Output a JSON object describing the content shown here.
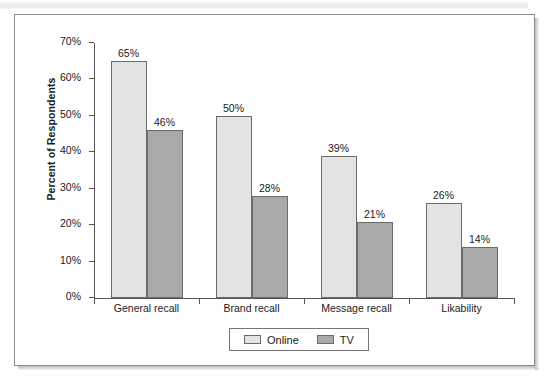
{
  "chart_data": {
    "type": "bar",
    "title": "",
    "xlabel": "",
    "ylabel": "Percent of Respondents",
    "ylim": [
      0,
      70
    ],
    "ytick_labels": [
      "0%",
      "10%",
      "20%",
      "30%",
      "40%",
      "50%",
      "60%",
      "70%"
    ],
    "ytick_values": [
      0,
      10,
      20,
      30,
      40,
      50,
      60,
      70
    ],
    "grid": false,
    "legend_position": "bottom-center",
    "categories": [
      "General recall",
      "Brand recall",
      "Message recall",
      "Likability"
    ],
    "series": [
      {
        "name": "Online",
        "color": "#e3e3e3",
        "values": [
          65,
          50,
          39,
          26
        ],
        "value_labels": [
          "65%",
          "50%",
          "39%",
          "26%"
        ]
      },
      {
        "name": "TV",
        "color": "#a9a9a9",
        "values": [
          46,
          28,
          21,
          14
        ],
        "value_labels": [
          "46%",
          "28%",
          "21%",
          "14%"
        ]
      }
    ]
  },
  "legend": {
    "items": [
      {
        "label": "Online",
        "swatch": "online"
      },
      {
        "label": "TV",
        "swatch": "tv"
      }
    ]
  },
  "colors": {
    "online_fill": "#e3e3e3",
    "tv_fill": "#a9a9a9",
    "bar_outline": "#6b6b6b",
    "axis": "#555555",
    "text": "#1b1b1b",
    "frame": "#8d8d8d"
  }
}
